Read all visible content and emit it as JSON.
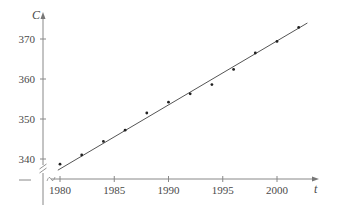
{
  "chart_data": {
    "type": "scatter",
    "title": "",
    "xlabel": "t",
    "ylabel": "C",
    "x_ticks": [
      1980,
      1985,
      1990,
      1995,
      2000
    ],
    "y_ticks": [
      340,
      350,
      360,
      370
    ],
    "xlim": [
      1978,
      2004
    ],
    "ylim": [
      336,
      374
    ],
    "grid": false,
    "legend": null,
    "axis_breaks": {
      "x": true,
      "y": true
    },
    "series": [
      {
        "name": "data points",
        "type": "scatter",
        "x": [
          1980,
          1982,
          1984,
          1986,
          1988,
          1990,
          1992,
          1994,
          1996,
          1998,
          2000,
          2002
        ],
        "y": [
          338.7,
          341.0,
          344.4,
          347.2,
          351.5,
          354.2,
          356.3,
          358.6,
          362.4,
          366.5,
          369.4,
          372.9
        ]
      },
      {
        "name": "fit line",
        "type": "line",
        "x": [
          1979.8,
          2002.8
        ],
        "y": [
          337.2,
          374.0
        ]
      }
    ],
    "colors": {
      "axis": "#888888",
      "line": "#555555",
      "points": "#222222",
      "text": "#4a4a4a"
    }
  }
}
